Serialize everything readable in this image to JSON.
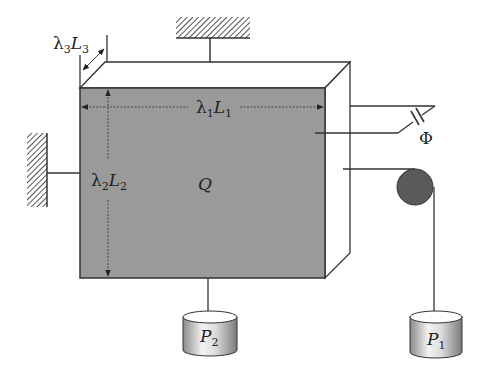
{
  "diagram": {
    "type": "physical-system-schematic",
    "body_label": "Q",
    "dimensions": {
      "length1": {
        "coef": "λ",
        "coef_sub": "1",
        "var": "L",
        "var_sub": "1"
      },
      "length2": {
        "coef": "λ",
        "coef_sub": "2",
        "var": "L",
        "var_sub": "2"
      },
      "length3": {
        "coef": "λ",
        "coef_sub": "3",
        "var": "L",
        "var_sub": "3"
      }
    },
    "potential_label": "Φ",
    "weights": [
      {
        "id": "P1",
        "var": "P",
        "sub": "1"
      },
      {
        "id": "P2",
        "var": "P",
        "sub": "2"
      }
    ],
    "colors": {
      "face": "#9a9a9a",
      "line": "#333333",
      "pulley": "#5a5a5a",
      "hatch": "#555555"
    }
  }
}
